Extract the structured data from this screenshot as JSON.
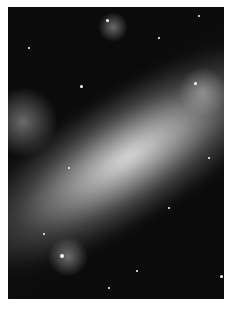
{
  "image": {
    "subject": "grayscale astronomical photograph of an irregular galaxy with a diagonal bright bar",
    "colors": {
      "background": "#ffffff",
      "sky": "#0b0b0b",
      "core": "#e6e6e6"
    }
  }
}
